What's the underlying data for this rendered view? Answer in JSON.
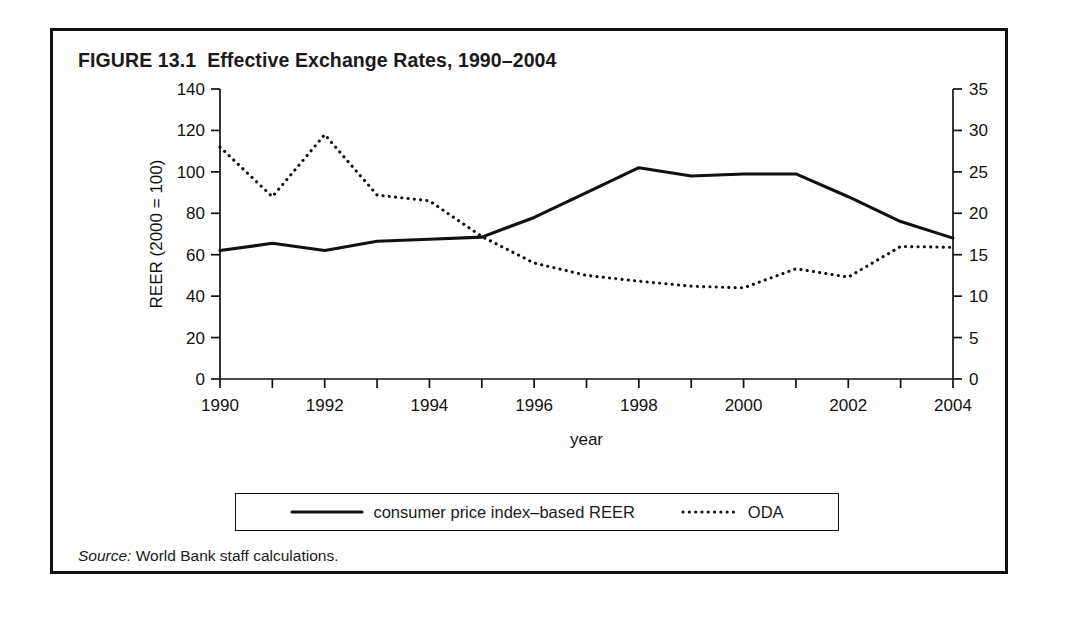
{
  "figure": {
    "label": "FIGURE 13.1",
    "title": "Effective Exchange Rates, 1990–2004",
    "full_title": "FIGURE 13.1  Effective Exchange Rates, 1990–2004",
    "source_prefix": "Source:",
    "source_text": " World Bank staff calculations."
  },
  "legend": {
    "items": [
      {
        "label": "consumer price index–based REER",
        "style": "solid",
        "color": "#111111"
      },
      {
        "label": "ODA",
        "style": "dotted",
        "color": "#111111"
      }
    ]
  },
  "chart_data": {
    "type": "line",
    "title": "Effective Exchange Rates, 1990–2004",
    "xlabel": "year",
    "ylabel": "REER (2000 = 100)",
    "y2label": "ODA (% of GDP)",
    "grid": false,
    "legend_position": "bottom",
    "x": [
      1990,
      1991,
      1992,
      1993,
      1994,
      1995,
      1996,
      1997,
      1998,
      1999,
      2000,
      2001,
      2002,
      2003,
      2004
    ],
    "xlim": [
      1990,
      2004
    ],
    "xticks": [
      1990,
      1991,
      1992,
      1993,
      1994,
      1995,
      1996,
      1997,
      1998,
      1999,
      2000,
      2001,
      2002,
      2003,
      2004
    ],
    "xtick_labels": [
      "1990",
      "",
      "1992",
      "",
      "1994",
      "",
      "1996",
      "",
      "1998",
      "",
      "2000",
      "",
      "2002",
      "",
      "2004"
    ],
    "ylim": [
      0,
      140
    ],
    "yticks": [
      0,
      20,
      40,
      60,
      80,
      100,
      120,
      140
    ],
    "ytick_labels": [
      "0",
      "20",
      "40",
      "60",
      "80",
      "100",
      "120",
      "140"
    ],
    "y2lim": [
      0,
      35
    ],
    "y2ticks": [
      0,
      5,
      10,
      15,
      20,
      25,
      30,
      35
    ],
    "y2tick_labels": [
      "0",
      "5",
      "10",
      "15",
      "20",
      "25",
      "30",
      "35"
    ],
    "series": [
      {
        "name": "consumer price index–based REER",
        "axis": "left",
        "style": "solid",
        "values": [
          62,
          65.5,
          62,
          66.5,
          67.5,
          68.5,
          78,
          90,
          102,
          98,
          99,
          99,
          88,
          76,
          68
        ]
      },
      {
        "name": "ODA",
        "axis": "right",
        "style": "dotted",
        "values": [
          28,
          22,
          29.5,
          22.2,
          21.5,
          17.2,
          14,
          12.5,
          11.8,
          11.2,
          11,
          13.3,
          12.3,
          16,
          15.9
        ]
      }
    ]
  }
}
